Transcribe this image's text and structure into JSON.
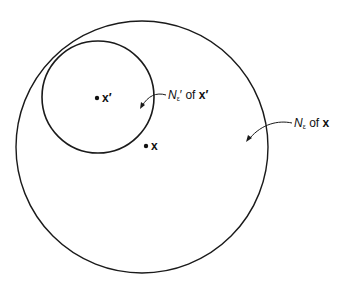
{
  "diagram": {
    "outer_circle": {
      "cx": 142,
      "cy": 147,
      "r": 126,
      "label_N": "N",
      "label_sub": "ε",
      "label_of": " of ",
      "label_point": "x"
    },
    "inner_circle": {
      "cx": 98,
      "cy": 97,
      "r": 56,
      "label_N": "N",
      "label_sub": "ε",
      "label_prime": "′",
      "label_of": " of ",
      "label_point": "x′"
    },
    "points": [
      {
        "name": "x-prime",
        "label": "x′",
        "cx": 97,
        "cy": 98
      },
      {
        "name": "x",
        "label": "x",
        "cx": 146,
        "cy": 146
      }
    ],
    "stroke_color": "#1a1a1a"
  }
}
